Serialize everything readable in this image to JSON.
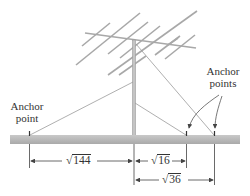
{
  "labels": {
    "left_anchor": [
      "Anchor",
      "point"
    ],
    "right_anchors": [
      "Anchor",
      "points"
    ]
  },
  "measurements": [
    {
      "id": "left-distance",
      "radical": "√",
      "radicand": "144"
    },
    {
      "id": "near-distance",
      "radical": "√",
      "radicand": "16"
    },
    {
      "id": "far-distance",
      "radical": "√",
      "radicand": "36"
    }
  ],
  "colors": {
    "ground": "#b8b8b8",
    "antenna": "#a8a8a8",
    "wire": "#9a9a9a",
    "line": "#444444"
  }
}
